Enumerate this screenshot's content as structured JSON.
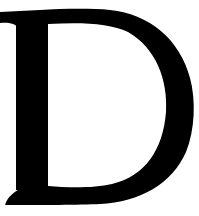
{
  "letter": {
    "character": "D",
    "style": "serif",
    "fill_color": "#000000",
    "background_color": "#ffffff"
  }
}
